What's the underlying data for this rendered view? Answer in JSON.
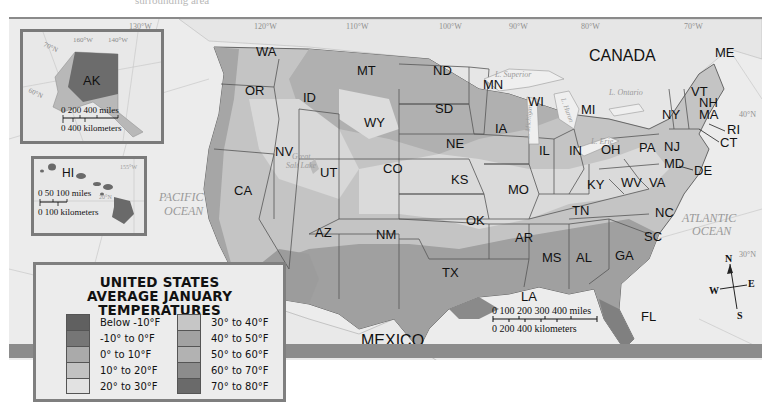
{
  "top_caption": "surrounding area",
  "legend": {
    "title_line1": "UNITED STATES",
    "title_line2": "AVERAGE JANUARY TEMPERATURES",
    "left_items": [
      {
        "label": "Below -10°F",
        "color": "#606060"
      },
      {
        "label": "-10° to 0°F",
        "color": "#767676"
      },
      {
        "label": "0° to 10°F",
        "color": "#aaaaaa"
      },
      {
        "label": "10° to 20°F",
        "color": "#c2c2c2"
      },
      {
        "label": "20° to 30°F",
        "color": "#e2e2e2"
      }
    ],
    "right_items": [
      {
        "label": "30° to 40°F",
        "color": "#c6c6c6"
      },
      {
        "label": "40° to 50°F",
        "color": "#a2a2a2"
      },
      {
        "label": "50° to 60°F",
        "color": "#b2b2b2"
      },
      {
        "label": "60° to 70°F",
        "color": "#8c8c8c"
      },
      {
        "label": "70° to 80°F",
        "color": "#6a6a6a"
      }
    ]
  },
  "countries": {
    "canada": "CANADA",
    "mexico": "MEXICO"
  },
  "water": {
    "pacific_line1": "PACIFIC",
    "pacific_line2": "OCEAN",
    "atlantic_line1": "ATLANTIC",
    "atlantic_line2": "OCEAN",
    "superior": "L. Superior",
    "ontario": "L. Ontario",
    "michigan": "L. Michigan",
    "huron": "L. Huron",
    "erie": "L. Erie",
    "great_salt_lake_line1": "Great",
    "great_salt_lake_line2": "Salt Lake"
  },
  "meridians": [
    "130°W",
    "120°W",
    "110°W",
    "100°W",
    "90°W",
    "80°W",
    "70°W"
  ],
  "parallels": [
    "40°N",
    "30°N"
  ],
  "states": {
    "WA": "WA",
    "OR": "OR",
    "CA": "CA",
    "ID": "ID",
    "NV": "NV",
    "MT": "MT",
    "WY": "WY",
    "UT": "UT",
    "CO": "CO",
    "AZ": "AZ",
    "NM": "NM",
    "ND": "ND",
    "SD": "SD",
    "NE": "NE",
    "KS": "KS",
    "OK": "OK",
    "TX": "TX",
    "MN": "MN",
    "IA": "IA",
    "MO": "MO",
    "AR": "AR",
    "LA": "LA",
    "WI": "WI",
    "IL": "IL",
    "MI": "MI",
    "IN": "IN",
    "OH": "OH",
    "KY": "KY",
    "TN": "TN",
    "MS": "MS",
    "AL": "AL",
    "GA": "GA",
    "FL": "FL",
    "SC": "SC",
    "NC": "NC",
    "VA": "VA",
    "WV": "WV",
    "PA": "PA",
    "NY": "NY",
    "VT": "VT",
    "NH": "NH",
    "ME": "ME",
    "MA": "MA",
    "RI": "RI",
    "CT": "CT",
    "NJ": "NJ",
    "DE": "DE",
    "MD": "MD"
  },
  "alaska_inset": {
    "label": "AK",
    "meridians": [
      "160°W",
      "140°W"
    ],
    "parallels": [
      "70°N",
      "60°N"
    ],
    "scale_miles": "0   200  400 miles",
    "scale_km": "0      400 kilometers"
  },
  "hawaii_inset": {
    "label": "HI",
    "meridian": "155°W",
    "parallel": "20°N",
    "scale_miles": "0  50 100 miles",
    "scale_km": "0   100 kilometers"
  },
  "main_scale": {
    "miles": "0   100  200  300  400 miles",
    "km": "0    200    400 kilometers"
  },
  "compass": {
    "n": "N",
    "s": "S",
    "e": "E",
    "w": "W"
  }
}
